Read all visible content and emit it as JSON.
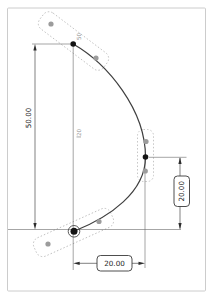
{
  "colors": {
    "background": "#ffffff",
    "frame_border": "#cccccc",
    "curve_stroke": "#3f3f3f",
    "dimension_stroke": "#4a4a4a",
    "dimension_text": "#1e1e1e",
    "handle_box_stroke": "#b8b8b8",
    "handle_point_fill": "#9c9c9c",
    "spline_point_fill": "#141414",
    "origin_ring_stroke": "#4a4a4a",
    "tiny_label_fill": "#8f8f8f"
  },
  "dimensions": {
    "left_vertical": {
      "value": "50.00",
      "boxed": false,
      "orientation": "vertical"
    },
    "right_vertical": {
      "value": "20.00",
      "boxed": true,
      "orientation": "vertical"
    },
    "bottom_horizontal": {
      "value": "20.00",
      "boxed": true,
      "orientation": "horizontal"
    }
  },
  "point_labels": {
    "top_point": "50",
    "middle_point": "20"
  }
}
